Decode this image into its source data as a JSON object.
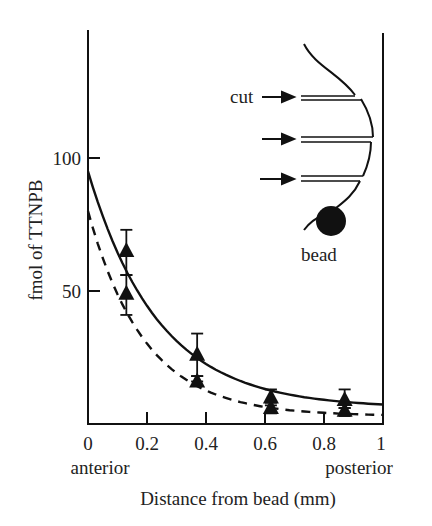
{
  "chart_data": {
    "type": "line",
    "title": "",
    "xlabel": "Distance from bead (mm)",
    "ylabel": "fmol of TTNPB",
    "xlim": [
      0,
      1
    ],
    "ylim": [
      0,
      150
    ],
    "x_ticks": [
      "0",
      "0.2",
      "0.4",
      "0.6",
      "0.8",
      "1"
    ],
    "y_ticks": [
      "50",
      "100"
    ],
    "x_end_labels": {
      "left": "anterior",
      "right": "posterior"
    },
    "grid": false,
    "legend": null,
    "series": [
      {
        "name": "solid",
        "style": "solid",
        "marker": "triangle",
        "points": [
          {
            "x": 0.13,
            "y": 65,
            "err_low": 56,
            "err_high": 73
          },
          {
            "x": 0.37,
            "y": 26,
            "err_low": 18,
            "err_high": 34
          },
          {
            "x": 0.62,
            "y": 10,
            "err_low": 7,
            "err_high": 13
          },
          {
            "x": 0.87,
            "y": 9,
            "err_low": 6,
            "err_high": 13
          }
        ],
        "fit_curve": {
          "y0": 95,
          "y_end": 6,
          "decay": 4.2
        }
      },
      {
        "name": "dashed",
        "style": "dashed",
        "marker": "triangle",
        "points": [
          {
            "x": 0.13,
            "y": 49,
            "err_low": 41,
            "err_high": 56
          },
          {
            "x": 0.37,
            "y": 16,
            "err_low": 16,
            "err_high": 18
          },
          {
            "x": 0.62,
            "y": 6,
            "err_low": 4,
            "err_high": 8
          },
          {
            "x": 0.87,
            "y": 5,
            "err_low": 3,
            "err_high": 6
          }
        ],
        "fit_curve": {
          "y0": 80,
          "y_end": 3,
          "decay": 5.2
        }
      }
    ],
    "inset": {
      "description": "Limb bud schematic with bead and three cuts",
      "labels": {
        "cut": "cut",
        "bead": "bead"
      },
      "cut_count": 3
    }
  },
  "colors": {
    "ink": "#111111",
    "background": "#ffffff"
  }
}
